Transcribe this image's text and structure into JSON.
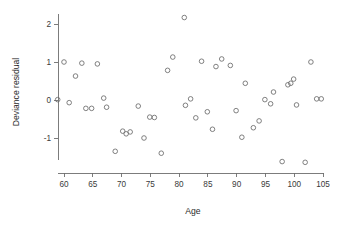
{
  "chart_data": {
    "type": "scatter",
    "title": "",
    "xlabel": "Age",
    "ylabel": "Deviance residual",
    "xlim": [
      58.2,
      105.8
    ],
    "ylim": [
      -1.75,
      2.35
    ],
    "grid": false,
    "legend": null,
    "marker": "open-circle",
    "marker_color": "#6a6a6a",
    "xticks": [
      60,
      65,
      70,
      75,
      80,
      85,
      90,
      95,
      100,
      105
    ],
    "xtick_labels": [
      "60",
      "65",
      "70",
      "75",
      "80",
      "85",
      "90",
      "95",
      "100",
      "105"
    ],
    "yticks": [
      -1,
      0,
      1,
      2
    ],
    "ytick_labels": [
      "-1",
      "0",
      "1",
      "2"
    ],
    "points": [
      {
        "x": 58.9,
        "y": 0.01
      },
      {
        "x": 60.0,
        "y": 1.0
      },
      {
        "x": 60.9,
        "y": -0.07
      },
      {
        "x": 62.0,
        "y": 0.63
      },
      {
        "x": 63.1,
        "y": 0.97
      },
      {
        "x": 63.8,
        "y": -0.22
      },
      {
        "x": 64.8,
        "y": -0.22
      },
      {
        "x": 65.8,
        "y": 0.95
      },
      {
        "x": 66.9,
        "y": 0.05
      },
      {
        "x": 67.4,
        "y": -0.19
      },
      {
        "x": 68.9,
        "y": -1.35
      },
      {
        "x": 70.2,
        "y": -0.82
      },
      {
        "x": 70.8,
        "y": -0.89
      },
      {
        "x": 71.5,
        "y": -0.84
      },
      {
        "x": 72.9,
        "y": -0.16
      },
      {
        "x": 73.9,
        "y": -1.0
      },
      {
        "x": 74.9,
        "y": -0.45
      },
      {
        "x": 75.7,
        "y": -0.46
      },
      {
        "x": 76.9,
        "y": -1.4
      },
      {
        "x": 78.0,
        "y": 0.78
      },
      {
        "x": 78.9,
        "y": 1.13
      },
      {
        "x": 80.9,
        "y": 2.17
      },
      {
        "x": 81.1,
        "y": -0.14
      },
      {
        "x": 82.0,
        "y": 0.03
      },
      {
        "x": 82.9,
        "y": -0.47
      },
      {
        "x": 83.9,
        "y": 1.02
      },
      {
        "x": 84.9,
        "y": -0.31
      },
      {
        "x": 85.8,
        "y": -0.77
      },
      {
        "x": 86.4,
        "y": 0.88
      },
      {
        "x": 87.4,
        "y": 1.08
      },
      {
        "x": 88.9,
        "y": 0.91
      },
      {
        "x": 89.9,
        "y": -0.28
      },
      {
        "x": 90.9,
        "y": -0.98
      },
      {
        "x": 91.5,
        "y": 0.44
      },
      {
        "x": 92.9,
        "y": -0.73
      },
      {
        "x": 93.9,
        "y": -0.55
      },
      {
        "x": 94.9,
        "y": 0.01
      },
      {
        "x": 95.9,
        "y": -0.1
      },
      {
        "x": 96.4,
        "y": 0.21
      },
      {
        "x": 97.9,
        "y": -1.62
      },
      {
        "x": 98.9,
        "y": 0.4
      },
      {
        "x": 99.4,
        "y": 0.44
      },
      {
        "x": 99.9,
        "y": 0.55
      },
      {
        "x": 100.4,
        "y": -0.13
      },
      {
        "x": 101.9,
        "y": -1.64
      },
      {
        "x": 102.9,
        "y": 1.0
      },
      {
        "x": 103.9,
        "y": 0.03
      },
      {
        "x": 104.7,
        "y": 0.03
      }
    ]
  }
}
